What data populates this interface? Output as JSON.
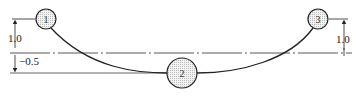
{
  "diagram": {
    "nodes": [
      {
        "id": "1",
        "label": "1"
      },
      {
        "id": "2",
        "label": "2"
      },
      {
        "id": "3",
        "label": "3"
      }
    ],
    "dimensions": {
      "left_upper": "1.0",
      "left_lower": "−0.5",
      "right_upper": "1.0"
    },
    "colors": {
      "line": "#222222",
      "node_fill": "#e6e6e6",
      "centerline": "#444444"
    }
  }
}
